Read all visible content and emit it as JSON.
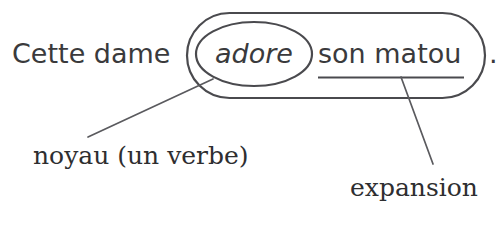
{
  "diagram": {
    "sentence": {
      "subject_text": "Cette dame",
      "verb_text": "adore",
      "complement_text": "son matou",
      "final_punctuation": "."
    },
    "annotations": {
      "verb_label": "noyau (un verbe)",
      "complement_label": "expansion"
    },
    "shapes": {
      "outer_container": "rounded-rectangle",
      "verb_container": "ellipse",
      "complement_marker": "underline"
    },
    "colors": {
      "text": "#3a3a3c",
      "label_text": "#2e2e30",
      "stroke": "#4a4a4e",
      "leader": "#5a5a5e",
      "background": "#ffffff"
    }
  }
}
